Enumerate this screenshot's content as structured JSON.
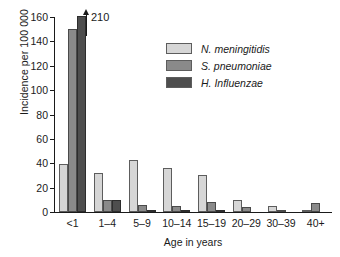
{
  "chart_data": {
    "type": "bar",
    "title": "",
    "xlabel": "Age in years",
    "ylabel": "Incidence per 100 000",
    "categories": [
      "<1",
      "1–4",
      "5–9",
      "10–14",
      "15–19",
      "20–29",
      "30–39",
      "40+"
    ],
    "series": [
      {
        "name": "N. meningitidis",
        "color": "#d6d6d6",
        "values": [
          39,
          32,
          43,
          36,
          30,
          10,
          5,
          2
        ]
      },
      {
        "name": "S. pneumoniae",
        "color": "#8a8a8a",
        "values": [
          150,
          10,
          6,
          5,
          8,
          4,
          2,
          7
        ]
      },
      {
        "name": "H. Influenzae",
        "color": "#4e4e4e",
        "values": [
          210,
          10,
          2,
          1,
          1,
          0,
          0,
          0
        ]
      }
    ],
    "ylim": [
      0,
      160
    ],
    "yticks": [
      0,
      20,
      40,
      60,
      80,
      100,
      120,
      140,
      160
    ],
    "grid": false,
    "legend_position": "top-center-right",
    "annotations": [
      {
        "name": "clipped-bar-value",
        "text": "210",
        "series": "H. Influenzae",
        "category": "<1",
        "note": "bar exceeds axis maximum; arrow indicates true value"
      }
    ]
  },
  "axis": {
    "y_tick_labels": [
      "0",
      "20",
      "40",
      "60",
      "80",
      "100",
      "120",
      "140",
      "160"
    ],
    "x_tick_labels": [
      "<1",
      "1–4",
      "5–9",
      "10–14",
      "15–19",
      "20–29",
      "30–39",
      "40+"
    ],
    "y_title": "Incidence per 100 000",
    "x_title": "Age in years"
  },
  "legend": {
    "items": [
      {
        "label": "N. meningitidis",
        "color": "#d6d6d6"
      },
      {
        "label": "S. pneumoniae",
        "color": "#8a8a8a"
      },
      {
        "label": "H. Influenzae",
        "color": "#4e4e4e"
      }
    ]
  }
}
